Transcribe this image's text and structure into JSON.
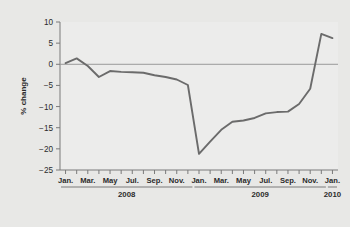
{
  "chart_data": {
    "type": "line",
    "title": "",
    "subtitle": "",
    "xlabel": "",
    "ylabel": "% change",
    "ylim": [
      -25,
      10
    ],
    "ytick_values": [
      10,
      5,
      0,
      -5,
      -10,
      -15,
      -20,
      -25
    ],
    "ytick_labels": [
      "10",
      "5",
      "0",
      "-5",
      "-10",
      "-15",
      "-20",
      "-25"
    ],
    "grid": false,
    "zero_line": true,
    "legend": "none",
    "line_color": "#6b6b6b",
    "plot_bg": "#ececeb",
    "figure_bg": "#e8e8e6",
    "axis_color": "#7a7a7a",
    "x_tick_interval_months": 1,
    "x_labeled_months": [
      "Jan.",
      "Mar.",
      "May",
      "Jul.",
      "Sep.",
      "Nov.",
      "Jan.",
      "Mar.",
      "May",
      "Jul.",
      "Sep.",
      "Nov.",
      "Jan."
    ],
    "year_groups": [
      {
        "label": "2008",
        "start_index": 0,
        "end_index": 11
      },
      {
        "label": "2009",
        "start_index": 12,
        "end_index": 23
      },
      {
        "label": "2010",
        "start_index": 24,
        "end_index": 24
      }
    ],
    "x": [
      "Jan. 2008",
      "Feb. 2008",
      "Mar. 2008",
      "Apr. 2008",
      "May 2008",
      "Jun. 2008",
      "Jul. 2008",
      "Aug. 2008",
      "Sep. 2008",
      "Oct. 2008",
      "Nov. 2008",
      "Dec. 2008",
      "Jan. 2009",
      "Feb. 2009",
      "Mar. 2009",
      "Apr. 2009",
      "May 2009",
      "Jun. 2009",
      "Jul. 2009",
      "Aug. 2009",
      "Sep. 2009",
      "Oct. 2009",
      "Nov. 2009",
      "Dec. 2009",
      "Jan. 2010"
    ],
    "values": [
      0.3,
      1.4,
      -0.4,
      -3.0,
      -1.6,
      -1.8,
      -1.9,
      -2.0,
      -2.6,
      -3.0,
      -3.6,
      -4.9,
      -21.2,
      -18.3,
      -15.5,
      -13.6,
      -13.3,
      -12.7,
      -11.6,
      -11.3,
      -11.2,
      -9.4,
      -5.8,
      7.2,
      6.2
    ],
    "series_name": "% change"
  }
}
